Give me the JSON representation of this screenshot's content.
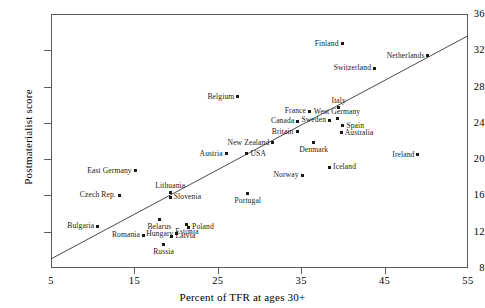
{
  "chart_data": {
    "type": "scatter",
    "title": "",
    "xlabel": "Percent of TFR at ages 30+",
    "ylabel": "Postmaterialist score",
    "xlim": [
      5,
      55
    ],
    "ylim": [
      8,
      36
    ],
    "xticks": [
      5,
      15,
      25,
      35,
      45,
      55
    ],
    "yticks": [
      8,
      12,
      16,
      20,
      24,
      28,
      32,
      36
    ],
    "grid": false,
    "legend": "none",
    "trendline": {
      "x0": 5,
      "y0": 9.0,
      "x1": 55,
      "y1": 33.6
    },
    "points": [
      {
        "label": "Finland",
        "x": 39.9,
        "y": 32.7,
        "pos": "left"
      },
      {
        "label": "Netherlands",
        "x": 50.2,
        "y": 31.4,
        "pos": "left"
      },
      {
        "label": "Switzerland",
        "x": 43.8,
        "y": 30.0,
        "pos": "left"
      },
      {
        "label": "Belgium",
        "x": 27.4,
        "y": 26.9,
        "pos": "left"
      },
      {
        "label": "Italy",
        "x": 39.5,
        "y": 25.7,
        "pos": "above"
      },
      {
        "label": "France",
        "x": 36.0,
        "y": 25.3,
        "pos": "left"
      },
      {
        "label": "West Germany",
        "x": 39.3,
        "y": 24.5,
        "pos": "above"
      },
      {
        "label": "Sweden",
        "x": 38.4,
        "y": 24.3,
        "pos": "left"
      },
      {
        "label": "Canada",
        "x": 34.6,
        "y": 24.2,
        "pos": "left"
      },
      {
        "label": "Spain",
        "x": 40.0,
        "y": 23.7,
        "pos": "right"
      },
      {
        "label": "Britain",
        "x": 34.5,
        "y": 23.0,
        "pos": "left"
      },
      {
        "label": "Australia",
        "x": 39.8,
        "y": 22.9,
        "pos": "right"
      },
      {
        "label": "New Zealand",
        "x": 31.6,
        "y": 21.8,
        "pos": "left"
      },
      {
        "label": "Denmark",
        "x": 36.5,
        "y": 21.8,
        "pos": "below"
      },
      {
        "label": "Ireland",
        "x": 49.0,
        "y": 20.5,
        "pos": "left"
      },
      {
        "label": "Austria",
        "x": 26.0,
        "y": 20.6,
        "pos": "left"
      },
      {
        "label": "USA",
        "x": 28.5,
        "y": 20.6,
        "pos": "right"
      },
      {
        "label": "Iceland",
        "x": 38.4,
        "y": 19.1,
        "pos": "right"
      },
      {
        "label": "Norway",
        "x": 35.1,
        "y": 18.2,
        "pos": "left"
      },
      {
        "label": "East Germany",
        "x": 15.1,
        "y": 18.7,
        "pos": "left"
      },
      {
        "label": "Czech Rep.",
        "x": 13.2,
        "y": 16.0,
        "pos": "left"
      },
      {
        "label": "Lithuania",
        "x": 19.3,
        "y": 16.3,
        "pos": "above"
      },
      {
        "label": "Slovenia",
        "x": 19.3,
        "y": 15.8,
        "pos": "right"
      },
      {
        "label": "Portugal",
        "x": 28.6,
        "y": 16.2,
        "pos": "below"
      },
      {
        "label": "Belarus",
        "x": 18.0,
        "y": 13.4,
        "pos": "below"
      },
      {
        "label": "Estonia",
        "x": 21.3,
        "y": 12.8,
        "pos": "below"
      },
      {
        "label": "Poland",
        "x": 21.5,
        "y": 12.5,
        "pos": "right"
      },
      {
        "label": "Bulgaria",
        "x": 10.6,
        "y": 12.6,
        "pos": "left"
      },
      {
        "label": "Hungary",
        "x": 20.1,
        "y": 11.8,
        "pos": "left"
      },
      {
        "label": "Romania",
        "x": 16.1,
        "y": 11.6,
        "pos": "left"
      },
      {
        "label": "Latvia",
        "x": 19.5,
        "y": 11.5,
        "pos": "right"
      },
      {
        "label": "Russia",
        "x": 18.5,
        "y": 10.6,
        "pos": "below"
      }
    ]
  },
  "style": {
    "axis_color": "#5a5a5a",
    "marker_color": "#1a1a1a",
    "line_color": "#4a4a4a",
    "background": "#ffffff"
  }
}
